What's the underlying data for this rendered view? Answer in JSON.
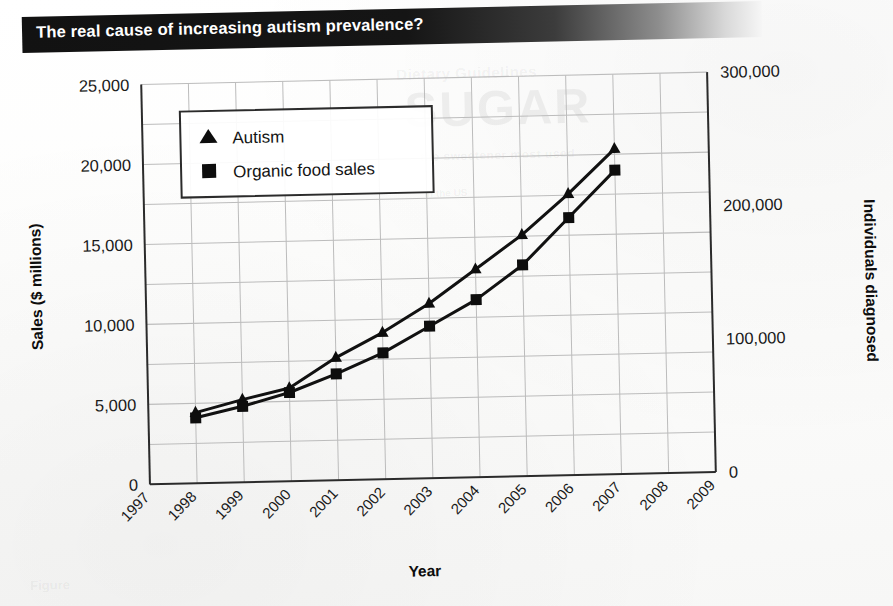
{
  "banner": {
    "title": "The real cause of increasing autism prevalence?"
  },
  "background_showthrough": {
    "line1": "Dietary Guidelines",
    "line2": "SUGAR",
    "line3": "the sweetener most used",
    "line4": "in the US",
    "line5": "Figure"
  },
  "chart_data": {
    "type": "line",
    "title": "The real cause of increasing autism prevalence?",
    "xlabel": "Year",
    "ylabel": "Sales ($ millions)",
    "y2label": "Individuals diagnosed",
    "x": [
      1998,
      1999,
      2000,
      2001,
      2002,
      2003,
      2004,
      2005,
      2006,
      2007
    ],
    "xlim": [
      1997,
      2009
    ],
    "ylim": [
      0,
      25000
    ],
    "y2lim": [
      0,
      300000
    ],
    "xticks": [
      "1997",
      "1998",
      "1999",
      "2000",
      "2001",
      "2002",
      "2003",
      "2004",
      "2005",
      "2006",
      "2007",
      "2008",
      "2009"
    ],
    "yticks": [
      "0",
      "5,000",
      "10,000",
      "15,000",
      "20,000",
      "25,000"
    ],
    "ytick_values": [
      0,
      5000,
      10000,
      15000,
      20000,
      25000
    ],
    "y2ticks": [
      "0",
      "100,000",
      "200,000",
      "300,000"
    ],
    "y2tick_values": [
      0,
      100000,
      200000,
      300000
    ],
    "grid": true,
    "grid_minor_step": 2500,
    "legend_position": "upper left",
    "series": [
      {
        "name": "Autism",
        "marker": "triangle",
        "axis": "right",
        "units": "individuals diagnosed",
        "values": [
          53000,
          62000,
          70000,
          92000,
          110000,
          131000,
          156000,
          181000,
          211000,
          244000
        ],
        "values_left_axis_equivalent": [
          4400,
          5150,
          5850,
          7650,
          9150,
          10900,
          13000,
          15100,
          17600,
          20300
        ]
      },
      {
        "name": "Organic food sales",
        "marker": "square",
        "axis": "left",
        "units": "$ millions",
        "values": [
          4100,
          4750,
          5550,
          6650,
          7900,
          9500,
          11100,
          13200,
          16100,
          19000
        ]
      }
    ]
  }
}
